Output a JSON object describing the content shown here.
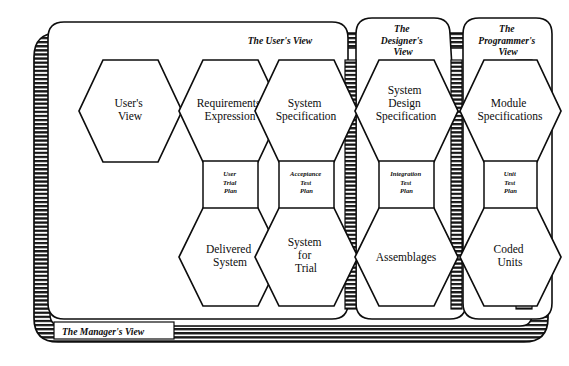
{
  "diagram": {
    "outer_frame": {
      "label": "The Manager's View"
    },
    "colors": {
      "ink": "#0d0d0d",
      "paper": "#ffffff",
      "hatch": "#1a1a1a"
    },
    "panels": [
      {
        "id": "user",
        "label": "The User's View",
        "label_lines": [
          "The User's View"
        ]
      },
      {
        "id": "designer",
        "label": "The Designer's View",
        "label_lines": [
          "The",
          "Designer's",
          "View"
        ]
      },
      {
        "id": "programmer",
        "label": "The Programmer's View",
        "label_lines": [
          "The",
          "Programmer's",
          "View"
        ]
      }
    ],
    "hexagons_top": [
      {
        "id": "users-view",
        "lines": [
          "User's",
          "View"
        ],
        "panel": "user"
      },
      {
        "id": "requirements-expression",
        "lines": [
          "Requirements",
          "Expression"
        ],
        "panel": "user"
      },
      {
        "id": "system-specification",
        "lines": [
          "System",
          "Specification"
        ],
        "panel": "user"
      },
      {
        "id": "system-design-specification",
        "lines": [
          "System",
          "Design",
          "Specification"
        ],
        "panel": "designer"
      },
      {
        "id": "module-specifications",
        "lines": [
          "Module",
          "Specifications"
        ],
        "panel": "programmer"
      }
    ],
    "hexagons_bottom": [
      {
        "id": "delivered-system",
        "lines": [
          "Delivered",
          "System"
        ],
        "panel": "user"
      },
      {
        "id": "system-for-trial",
        "lines": [
          "System",
          "for",
          "Trial"
        ],
        "panel": "user"
      },
      {
        "id": "assemblages",
        "lines": [
          "Assemblages"
        ],
        "panel": "designer"
      },
      {
        "id": "coded-units",
        "lines": [
          "Coded",
          "Units"
        ],
        "panel": "programmer"
      }
    ],
    "test_plans": [
      {
        "id": "user-trial-plan",
        "lines": [
          "User",
          "Trial",
          "Plan"
        ]
      },
      {
        "id": "acceptance-test-plan",
        "lines": [
          "Acceptance",
          "Test",
          "Plan"
        ]
      },
      {
        "id": "integration-test-plan",
        "lines": [
          "Integration",
          "Test",
          "Plan"
        ]
      },
      {
        "id": "unit-test-plan",
        "lines": [
          "Unit",
          "Test",
          "Plan"
        ]
      }
    ]
  }
}
